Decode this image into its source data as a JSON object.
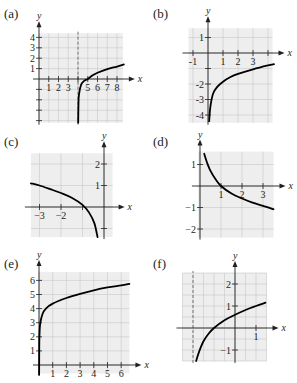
{
  "colors": {
    "grid_bg": "#eeeeee",
    "grid_line": "#c8c8c8",
    "axis": "#231f20",
    "curve": "#000000"
  },
  "chart_data": [
    {
      "id": "a",
      "label": "(a)",
      "type": "line",
      "xlabel": "x",
      "ylabel": "y",
      "origin": [
        39,
        79
      ],
      "unit": [
        9.75,
        10.4
      ],
      "grid": [
        0,
        8.6,
        -4.2,
        4.4
      ],
      "grid_step": 1,
      "x_ticks": [
        1,
        2,
        3,
        4,
        5,
        6,
        7,
        8
      ],
      "x_tick_labels": [
        "1",
        "2",
        "3",
        "",
        "5",
        "6",
        "7",
        "8"
      ],
      "y_ticks": [
        -4,
        -3,
        -2,
        -1,
        1,
        2,
        3,
        4
      ],
      "y_tick_labels": [
        "",
        "",
        "",
        "",
        "1",
        "2",
        "3",
        "4"
      ],
      "asymptote_x": 4,
      "fn": "log10(x-4)*... ",
      "curve": [
        [
          4.02,
          -4.2
        ],
        [
          4.05,
          -2.3
        ],
        [
          4.1,
          -1.5
        ],
        [
          4.3,
          -0.6
        ],
        [
          4.6,
          -0.2
        ],
        [
          5,
          0
        ],
        [
          5.5,
          0.35
        ],
        [
          6,
          0.6
        ],
        [
          7,
          0.95
        ],
        [
          8,
          1.2
        ],
        [
          8.7,
          1.4
        ]
      ]
    },
    {
      "id": "b",
      "label": "(b)",
      "type": "line",
      "xlabel": "x",
      "ylabel": "y",
      "origin": [
        208,
        53
      ],
      "unit": [
        15,
        15.5
      ],
      "grid": [
        -1.3,
        4.3,
        -4.5,
        1.6
      ],
      "grid_step": 1,
      "x_ticks": [
        -1,
        1,
        2,
        3,
        4
      ],
      "x_tick_labels": [
        "-1",
        "1",
        "2",
        "3",
        ""
      ],
      "y_ticks": [
        -4,
        -3,
        -2,
        -1,
        1
      ],
      "y_tick_labels": [
        "-4",
        "-3",
        "-2",
        "",
        "1"
      ],
      "curve": [
        [
          0.08,
          -4.4
        ],
        [
          0.12,
          -3.8
        ],
        [
          0.2,
          -3.2
        ],
        [
          0.35,
          -2.6
        ],
        [
          0.6,
          -2.2
        ],
        [
          1,
          -1.85
        ],
        [
          1.5,
          -1.55
        ],
        [
          2,
          -1.35
        ],
        [
          3,
          -1.05
        ],
        [
          4,
          -0.8
        ],
        [
          4.4,
          -0.72
        ]
      ]
    },
    {
      "id": "c",
      "label": "(c)",
      "type": "line",
      "xlabel": "x",
      "ylabel": "y",
      "origin": [
        104,
        207
      ],
      "unit": [
        21.5,
        21.5
      ],
      "grid": [
        -3.4,
        0.4,
        -1.4,
        2.5
      ],
      "grid_step": 1,
      "x_ticks": [
        -3,
        -2,
        -1
      ],
      "x_tick_labels": [
        "−3",
        "−2",
        ""
      ],
      "y_ticks": [
        -1,
        1,
        2
      ],
      "y_tick_labels": [
        "",
        "1",
        "2"
      ],
      "curve": [
        [
          -3.4,
          1.1
        ],
        [
          -3,
          1.0
        ],
        [
          -2.5,
          0.83
        ],
        [
          -2,
          0.65
        ],
        [
          -1.5,
          0.43
        ],
        [
          -1,
          0.1
        ],
        [
          -0.7,
          -0.25
        ],
        [
          -0.45,
          -0.75
        ],
        [
          -0.3,
          -1.4
        ]
      ]
    },
    {
      "id": "d",
      "label": "(d)",
      "type": "line",
      "xlabel": "x",
      "ylabel": "y",
      "origin": [
        200,
        186
      ],
      "unit": [
        21,
        21.5
      ],
      "grid": [
        -0.1,
        3.5,
        -2.4,
        1.6
      ],
      "grid_step": 1,
      "x_ticks": [
        1,
        2,
        3
      ],
      "x_tick_labels": [
        "1",
        "2",
        "3"
      ],
      "y_ticks": [
        -2,
        -1,
        1
      ],
      "y_tick_labels": [
        "−2",
        "−1",
        "1"
      ],
      "curve": [
        [
          0.2,
          1.5
        ],
        [
          0.35,
          1.05
        ],
        [
          0.5,
          0.7
        ],
        [
          0.75,
          0.3
        ],
        [
          1,
          0
        ],
        [
          1.5,
          -0.35
        ],
        [
          2,
          -0.58
        ],
        [
          2.5,
          -0.77
        ],
        [
          3,
          -0.92
        ],
        [
          3.5,
          -1.08
        ]
      ]
    },
    {
      "id": "e",
      "label": "(e)",
      "type": "line",
      "xlabel": "x",
      "ylabel": "y",
      "origin": [
        39,
        365
      ],
      "unit": [
        13.7,
        14.1
      ],
      "grid": [
        0,
        6.6,
        -0.6,
        6.6
      ],
      "grid_step": 1,
      "x_ticks": [
        1,
        2,
        3,
        4,
        5,
        6
      ],
      "x_tick_labels": [
        "1",
        "2",
        "3",
        "4",
        "5",
        "6"
      ],
      "y_ticks": [
        1,
        2,
        3,
        4,
        5,
        6
      ],
      "y_tick_labels": [
        "1",
        "2",
        "3",
        "4",
        "5",
        "6"
      ],
      "curve": [
        [
          0.01,
          -0.7
        ],
        [
          0.02,
          1.5
        ],
        [
          0.05,
          2.5
        ],
        [
          0.1,
          3.0
        ],
        [
          0.25,
          3.6
        ],
        [
          0.5,
          4.0
        ],
        [
          1,
          4.35
        ],
        [
          2,
          4.75
        ],
        [
          3,
          5.05
        ],
        [
          4,
          5.3
        ],
        [
          5,
          5.5
        ],
        [
          6,
          5.65
        ],
        [
          6.6,
          5.75
        ]
      ]
    },
    {
      "id": "f",
      "label": "(f)",
      "type": "line",
      "xlabel": "x",
      "ylabel": "y",
      "origin": [
        235,
        328
      ],
      "unit": [
        21,
        22
      ],
      "grid": [
        -2.5,
        1.5,
        -1.5,
        2.5
      ],
      "grid_step": 1,
      "x_ticks": [
        1
      ],
      "x_tick_labels": [
        "1"
      ],
      "y_ticks": [
        -1,
        1,
        2
      ],
      "y_tick_labels": [
        "−1",
        "1",
        "2"
      ],
      "asymptote_x": -2,
      "curve": [
        [
          -1.85,
          -1.5
        ],
        [
          -1.7,
          -1.05
        ],
        [
          -1.5,
          -0.6
        ],
        [
          -1.25,
          -0.25
        ],
        [
          -1,
          0
        ],
        [
          -0.5,
          0.35
        ],
        [
          0,
          0.6
        ],
        [
          0.5,
          0.82
        ],
        [
          1,
          1.0
        ],
        [
          1.45,
          1.15
        ]
      ]
    }
  ]
}
